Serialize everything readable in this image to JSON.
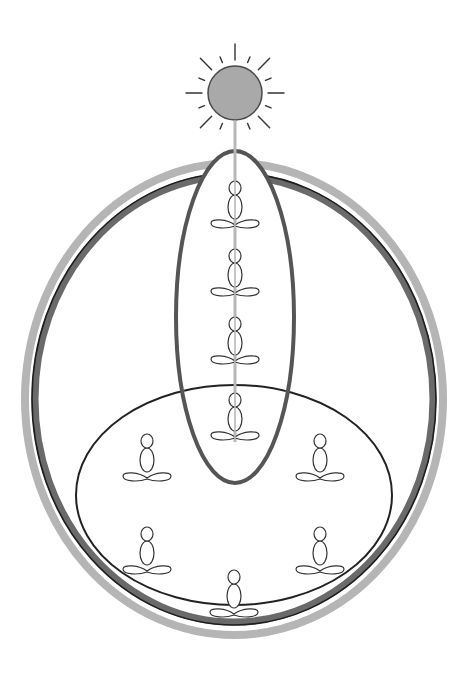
{
  "diagram": {
    "title": "",
    "colors": {
      "background": "#ffffff",
      "sun_fill": "#a9a9a9",
      "sun_stroke": "#4a4a4a",
      "beam": "#b8b8b8",
      "outer_ring_light": "#b5b5b5",
      "outer_ring_dark": "#6a6a6a",
      "outer_ring_edge": "#1e1e1e",
      "tall_ellipse": "#555555",
      "lower_ellipse": "#222222",
      "figure_stroke": "#333333"
    },
    "sun": {
      "cx": 235,
      "cy": 93,
      "r": 27,
      "rays": 16
    },
    "beam": {
      "x": 235,
      "y1": 120,
      "y2": 442
    },
    "outer_ring": {
      "cx": 234,
      "cy": 399,
      "rx_light": 209,
      "ry_light": 236,
      "rx_dark": 199,
      "ry_dark": 223
    },
    "tall_ellipse": {
      "cx": 235,
      "cy": 317,
      "rx": 59,
      "ry": 166
    },
    "lower_ellipse": {
      "cx": 234,
      "cy": 495,
      "rx": 158,
      "ry": 110
    },
    "figures": {
      "column": [
        {
          "label": "meditator-1",
          "x": 235,
          "y": 188
        },
        {
          "label": "meditator-2",
          "x": 235,
          "y": 256
        },
        {
          "label": "meditator-3",
          "x": 235,
          "y": 324
        },
        {
          "label": "meditator-4",
          "x": 235,
          "y": 400
        }
      ],
      "circle": [
        {
          "label": "meditator-upper-left",
          "x": 147,
          "y": 441
        },
        {
          "label": "meditator-upper-right",
          "x": 320,
          "y": 441
        },
        {
          "label": "meditator-lower-left",
          "x": 147,
          "y": 534
        },
        {
          "label": "meditator-lower-right",
          "x": 320,
          "y": 534
        },
        {
          "label": "meditator-bottom-center",
          "x": 234,
          "y": 577
        }
      ]
    }
  }
}
